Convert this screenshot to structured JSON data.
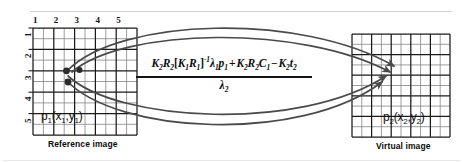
{
  "figure": {
    "colors": {
      "grid_major": "#1a1a1a",
      "grid_minor": "#6e6e6e",
      "curve": "#4a4a4a",
      "point": "#2b2b2b",
      "text": "#111111",
      "background": "#ffffff",
      "top_rule": "#cccccc"
    }
  },
  "reference_panel": {
    "caption": "Reference image",
    "point_label": "p",
    "point_sub": "1",
    "point_args_open": "(x",
    "point_args_sub1": "1",
    "point_args_comma": ",y",
    "point_args_sub2": "1",
    "point_args_close": ")",
    "point_label_full": "p1(x1,y1)",
    "top_ticks": [
      "1",
      "2",
      "3",
      "4",
      "5"
    ],
    "left_ticks": [
      "1",
      "2",
      "3",
      "4",
      "5"
    ],
    "grid_cols": 5,
    "grid_rows": 5,
    "subdivisions": 2,
    "source_points": [
      {
        "col": 2.5,
        "row": 2.5
      },
      {
        "col": 3.0,
        "row": 2.5
      },
      {
        "col": 2.5,
        "row": 3.0
      }
    ]
  },
  "virtual_panel": {
    "caption": "Virtual image",
    "point_label": "p",
    "point_sub": "2",
    "point_args_open": "(x",
    "point_args_sub1": "2",
    "point_args_comma": ",y",
    "point_args_sub2": "2",
    "point_args_close": ")",
    "point_label_full": "p2(x2,y2)",
    "grid_cols": 5,
    "grid_rows": 5,
    "subdivisions": 2
  },
  "equation": {
    "numerator_tokens": [
      {
        "t": "K",
        "sub": "2"
      },
      {
        "t": "R",
        "sub": "2"
      },
      {
        "t": "[",
        "brk": true
      },
      {
        "t": "K",
        "sub": "1"
      },
      {
        "t": "R",
        "sub": "1"
      },
      {
        "t": "]",
        "brk": true,
        "sup": "-1"
      },
      {
        "t": "λ",
        "sub": "1"
      },
      {
        "t": "p",
        "sub": "1"
      },
      {
        "t": "+",
        "op": true
      },
      {
        "t": "K",
        "sub": "2"
      },
      {
        "t": "R",
        "sub": "2"
      },
      {
        "t": "C",
        "sub": "1"
      },
      {
        "t": "−",
        "op": true
      },
      {
        "t": "K",
        "sub": "2"
      },
      {
        "t": "t",
        "sub": "2"
      }
    ],
    "numerator_plain": "K2R2[K1R1]^-1 λ1p1 + K2R2C1 − K2t2",
    "denominator_plain": "λ2",
    "denominator_symbol": "λ",
    "denominator_sub": "2"
  },
  "arrows": {
    "count": 4,
    "description": "Four curved arrows from the reference image points converging on the virtual image point"
  }
}
